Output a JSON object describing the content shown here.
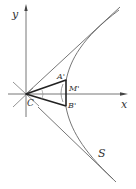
{
  "diagram": {
    "axes": {
      "x_label": "x",
      "y_label": "y"
    },
    "points": {
      "origin": "C",
      "a_prime": "A'",
      "b_prime": "B'",
      "m_prime": "M'"
    },
    "curve_label": "S",
    "colors": {
      "line": "#555555",
      "thick": "#222222",
      "text": "#333333"
    }
  }
}
